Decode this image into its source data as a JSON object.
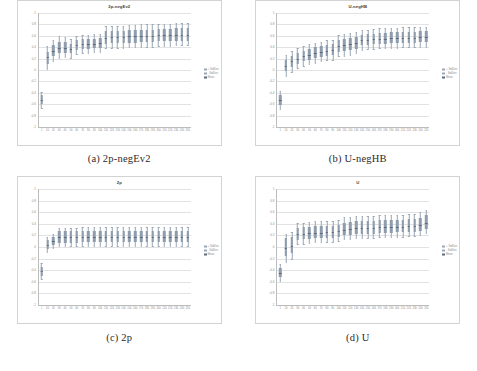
{
  "figure": {
    "panels": [
      {
        "key": "a",
        "caption": "(a) 2p-negEv2",
        "chart_title": "2p-negEv2"
      },
      {
        "key": "b",
        "caption": "(b) U-negHB",
        "chart_title": "U-negHB"
      },
      {
        "key": "c",
        "caption": "(c) 2p",
        "chart_title": "2p"
      },
      {
        "key": "d",
        "caption": "(d) U",
        "chart_title": "U"
      }
    ],
    "colors": {
      "box_fill": "#8e9cad",
      "median_line": "#5e6b7a",
      "whisker": "#9aa7b5",
      "gridline": "#e2e2e2",
      "axis": "#bdbdbd",
      "tick_text": "#8a8a8a",
      "title_text": "#404040",
      "caption_text": "#2b2b2b",
      "panel_border": "#d3d3d3"
    }
  },
  "chart_data": [
    {
      "type": "bar",
      "id": "2p-negEv2",
      "title": "2p-negEv2",
      "xlabel": "",
      "ylabel": "",
      "ylim": [
        -1,
        1
      ],
      "grid": true,
      "legend_position": "right",
      "legend": [
        "+ StdDev",
        "- StdDev",
        "Mean"
      ],
      "categories": [
        "1",
        "10",
        "20",
        "30",
        "40",
        "50",
        "60",
        "70",
        "80",
        "90",
        "100",
        "110",
        "120",
        "130",
        "140",
        "150",
        "160",
        "170",
        "180",
        "190",
        "200",
        "210",
        "220",
        "230",
        "240",
        "250"
      ],
      "yticks": [
        1,
        0.8,
        0.6,
        0.4,
        0.2,
        0,
        -0.2,
        -0.4,
        -0.6,
        -0.8,
        -1
      ],
      "series": [
        {
          "name": "median",
          "values": [
            -0.52,
            0.22,
            0.33,
            0.39,
            0.39,
            0.37,
            0.43,
            0.45,
            0.45,
            0.46,
            0.47,
            0.57,
            0.58,
            0.58,
            0.58,
            0.59,
            0.59,
            0.6,
            0.6,
            0.6,
            0.61,
            0.61,
            0.61,
            0.62,
            0.62,
            0.62
          ]
        },
        {
          "name": "q1",
          "values": [
            -0.6,
            0.11,
            0.24,
            0.29,
            0.3,
            0.29,
            0.35,
            0.37,
            0.37,
            0.38,
            0.39,
            0.46,
            0.47,
            0.47,
            0.47,
            0.48,
            0.48,
            0.49,
            0.49,
            0.49,
            0.5,
            0.5,
            0.5,
            0.51,
            0.51,
            0.51
          ]
        },
        {
          "name": "q3",
          "values": [
            -0.44,
            0.32,
            0.43,
            0.5,
            0.49,
            0.46,
            0.52,
            0.54,
            0.54,
            0.55,
            0.56,
            0.68,
            0.69,
            0.69,
            0.69,
            0.7,
            0.7,
            0.71,
            0.71,
            0.71,
            0.72,
            0.72,
            0.72,
            0.73,
            0.73,
            0.73
          ]
        },
        {
          "name": "low",
          "values": [
            -0.66,
            0.01,
            0.16,
            0.21,
            0.22,
            0.21,
            0.28,
            0.3,
            0.3,
            0.31,
            0.32,
            0.38,
            0.39,
            0.39,
            0.39,
            0.4,
            0.4,
            0.41,
            0.41,
            0.41,
            0.42,
            0.42,
            0.42,
            0.43,
            0.43,
            0.43
          ]
        },
        {
          "name": "high",
          "values": [
            -0.38,
            0.42,
            0.52,
            0.59,
            0.58,
            0.54,
            0.6,
            0.62,
            0.62,
            0.63,
            0.64,
            0.77,
            0.78,
            0.78,
            0.78,
            0.79,
            0.79,
            0.8,
            0.8,
            0.8,
            0.81,
            0.81,
            0.81,
            0.82,
            0.82,
            0.82
          ]
        }
      ]
    },
    {
      "type": "bar",
      "id": "U-negHB",
      "title": "U-negHB",
      "xlabel": "",
      "ylabel": "",
      "ylim": [
        -1,
        1
      ],
      "grid": true,
      "legend_position": "right",
      "legend": [
        "+ StdDev",
        "- StdDev",
        "Mean"
      ],
      "categories": [
        "1",
        "10",
        "20",
        "30",
        "40",
        "50",
        "60",
        "70",
        "80",
        "90",
        "100",
        "110",
        "120",
        "130",
        "140",
        "150",
        "160",
        "170",
        "180",
        "190",
        "200",
        "210",
        "220",
        "230",
        "240",
        "250"
      ],
      "yticks": [
        1,
        0.8,
        0.6,
        0.4,
        0.2,
        0,
        -0.2,
        -0.4,
        -0.6,
        -0.8,
        -1
      ],
      "series": [
        {
          "name": "median",
          "values": [
            -0.52,
            0.07,
            0.15,
            0.2,
            0.24,
            0.27,
            0.3,
            0.32,
            0.34,
            0.35,
            0.42,
            0.43,
            0.45,
            0.47,
            0.52,
            0.53,
            0.54,
            0.55,
            0.55,
            0.56,
            0.56,
            0.57,
            0.57,
            0.57,
            0.58,
            0.58
          ]
        },
        {
          "name": "q1",
          "values": [
            -0.61,
            -0.02,
            0.06,
            0.11,
            0.15,
            0.18,
            0.21,
            0.23,
            0.25,
            0.26,
            0.32,
            0.33,
            0.35,
            0.37,
            0.43,
            0.44,
            0.45,
            0.46,
            0.46,
            0.47,
            0.47,
            0.48,
            0.48,
            0.48,
            0.49,
            0.49
          ]
        },
        {
          "name": "q3",
          "values": [
            -0.43,
            0.17,
            0.25,
            0.3,
            0.34,
            0.37,
            0.4,
            0.42,
            0.44,
            0.45,
            0.53,
            0.54,
            0.56,
            0.58,
            0.62,
            0.63,
            0.64,
            0.65,
            0.65,
            0.66,
            0.66,
            0.67,
            0.67,
            0.67,
            0.68,
            0.68
          ]
        },
        {
          "name": "low",
          "values": [
            -0.68,
            -0.11,
            -0.03,
            0.03,
            0.07,
            0.1,
            0.13,
            0.15,
            0.17,
            0.18,
            0.24,
            0.25,
            0.27,
            0.29,
            0.35,
            0.36,
            0.37,
            0.38,
            0.38,
            0.39,
            0.39,
            0.4,
            0.4,
            0.4,
            0.41,
            0.41
          ]
        },
        {
          "name": "high",
          "values": [
            -0.36,
            0.26,
            0.34,
            0.38,
            0.42,
            0.45,
            0.48,
            0.5,
            0.52,
            0.53,
            0.62,
            0.63,
            0.65,
            0.67,
            0.7,
            0.71,
            0.72,
            0.73,
            0.73,
            0.74,
            0.74,
            0.75,
            0.75,
            0.75,
            0.76,
            0.76
          ]
        }
      ]
    },
    {
      "type": "bar",
      "id": "2p",
      "title": "2p",
      "xlabel": "",
      "ylabel": "",
      "ylim": [
        -1,
        1
      ],
      "grid": true,
      "legend_position": "right",
      "legend": [
        "+ StdDev",
        "- StdDev",
        "Mean"
      ],
      "categories": [
        "1",
        "10",
        "20",
        "30",
        "40",
        "50",
        "60",
        "70",
        "80",
        "90",
        "100",
        "110",
        "120",
        "130",
        "140",
        "150",
        "160",
        "170",
        "180",
        "190",
        "200",
        "210",
        "220",
        "230",
        "240",
        "250"
      ],
      "yticks": [
        1,
        0.8,
        0.6,
        0.4,
        0.2,
        0,
        -0.2,
        -0.4,
        -0.6,
        -0.8,
        -1
      ],
      "series": [
        {
          "name": "median",
          "values": [
            -0.42,
            0.04,
            0.1,
            0.17,
            0.17,
            0.17,
            0.17,
            0.17,
            0.18,
            0.18,
            0.18,
            0.18,
            0.18,
            0.18,
            0.18,
            0.18,
            0.18,
            0.18,
            0.18,
            0.18,
            0.18,
            0.18,
            0.18,
            0.18,
            0.18,
            0.18
          ]
        },
        {
          "name": "q1",
          "values": [
            -0.5,
            -0.03,
            0.03,
            0.07,
            0.07,
            0.07,
            0.07,
            0.08,
            0.08,
            0.08,
            0.08,
            0.08,
            0.08,
            0.08,
            0.08,
            0.08,
            0.08,
            0.08,
            0.08,
            0.08,
            0.08,
            0.08,
            0.08,
            0.08,
            0.08,
            0.08
          ]
        },
        {
          "name": "q3",
          "values": [
            -0.34,
            0.12,
            0.18,
            0.27,
            0.27,
            0.27,
            0.27,
            0.28,
            0.28,
            0.28,
            0.28,
            0.28,
            0.28,
            0.28,
            0.28,
            0.28,
            0.28,
            0.28,
            0.28,
            0.28,
            0.28,
            0.28,
            0.28,
            0.28,
            0.28,
            0.28
          ]
        },
        {
          "name": "low",
          "values": [
            -0.56,
            -0.09,
            -0.02,
            0.01,
            0.01,
            0.01,
            0.01,
            0.02,
            0.02,
            0.02,
            0.02,
            0.02,
            0.02,
            0.02,
            0.02,
            0.02,
            0.02,
            0.02,
            0.02,
            0.02,
            0.02,
            0.02,
            0.02,
            0.02,
            0.02,
            0.02
          ]
        },
        {
          "name": "high",
          "values": [
            -0.28,
            0.18,
            0.23,
            0.33,
            0.33,
            0.33,
            0.33,
            0.34,
            0.34,
            0.34,
            0.34,
            0.34,
            0.34,
            0.34,
            0.34,
            0.34,
            0.34,
            0.34,
            0.34,
            0.34,
            0.34,
            0.34,
            0.34,
            0.34,
            0.34,
            0.34
          ]
        }
      ]
    },
    {
      "type": "bar",
      "id": "U",
      "title": "U",
      "xlabel": "",
      "ylabel": "",
      "ylim": [
        -1,
        1
      ],
      "grid": true,
      "legend_position": "right",
      "legend": [
        "+ StdDev",
        "- StdDev",
        "Mean"
      ],
      "categories": [
        "1",
        "10",
        "20",
        "30",
        "40",
        "50",
        "60",
        "70",
        "80",
        "90",
        "100",
        "110",
        "120",
        "130",
        "140",
        "150",
        "160",
        "170",
        "180",
        "190",
        "200",
        "210",
        "220",
        "230",
        "240",
        "250"
      ],
      "yticks": [
        1,
        0.8,
        0.6,
        0.4,
        0.2,
        0,
        -0.2,
        -0.4,
        -0.6,
        -0.8,
        -1
      ],
      "series": [
        {
          "name": "median",
          "values": [
            -0.44,
            -0.02,
            0.02,
            0.22,
            0.23,
            0.24,
            0.25,
            0.25,
            0.26,
            0.26,
            0.27,
            0.3,
            0.31,
            0.32,
            0.32,
            0.33,
            0.33,
            0.34,
            0.34,
            0.34,
            0.35,
            0.35,
            0.36,
            0.36,
            0.38,
            0.42
          ]
        },
        {
          "name": "q1",
          "values": [
            -0.52,
            -0.16,
            -0.11,
            0.12,
            0.13,
            0.14,
            0.15,
            0.15,
            0.16,
            0.16,
            0.17,
            0.2,
            0.21,
            0.22,
            0.22,
            0.23,
            0.23,
            0.24,
            0.24,
            0.24,
            0.25,
            0.25,
            0.26,
            0.26,
            0.28,
            0.31
          ]
        },
        {
          "name": "q3",
          "values": [
            -0.36,
            0.15,
            0.18,
            0.33,
            0.34,
            0.35,
            0.36,
            0.36,
            0.37,
            0.37,
            0.38,
            0.42,
            0.43,
            0.44,
            0.44,
            0.45,
            0.45,
            0.46,
            0.46,
            0.46,
            0.47,
            0.47,
            0.48,
            0.48,
            0.5,
            0.55
          ]
        },
        {
          "name": "low",
          "values": [
            -0.58,
            -0.26,
            -0.2,
            0.05,
            0.06,
            0.07,
            0.08,
            0.08,
            0.09,
            0.09,
            0.1,
            0.13,
            0.14,
            0.15,
            0.15,
            0.16,
            0.16,
            0.17,
            0.17,
            0.17,
            0.18,
            0.18,
            0.19,
            0.19,
            0.21,
            0.24
          ]
        },
        {
          "name": "high",
          "values": [
            -0.3,
            0.23,
            0.26,
            0.41,
            0.42,
            0.43,
            0.44,
            0.44,
            0.45,
            0.45,
            0.46,
            0.51,
            0.52,
            0.53,
            0.53,
            0.54,
            0.54,
            0.55,
            0.55,
            0.55,
            0.56,
            0.56,
            0.57,
            0.57,
            0.6,
            0.64
          ]
        }
      ]
    }
  ]
}
